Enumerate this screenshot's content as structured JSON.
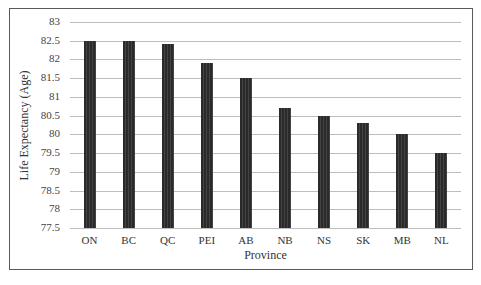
{
  "chart_data": {
    "type": "bar",
    "title": "",
    "xlabel": "Province",
    "ylabel": "Life Expectancy (Age)",
    "categories": [
      "ON",
      "BC",
      "QC",
      "PEI",
      "AB",
      "NB",
      "NS",
      "SK",
      "MB",
      "NL"
    ],
    "values": [
      82.5,
      82.5,
      82.4,
      81.9,
      81.5,
      80.7,
      80.5,
      80.3,
      80.0,
      79.5
    ],
    "ylim": [
      77.5,
      83
    ],
    "yticks": [
      "83",
      "82.5",
      "82",
      "81.5",
      "81",
      "80.5",
      "80",
      "79.5",
      "79",
      "78.5",
      "78",
      "77.5"
    ],
    "grid": true,
    "legend": null,
    "bar_color": "#2f2f2f"
  }
}
